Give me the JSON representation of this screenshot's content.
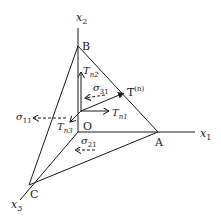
{
  "diagram": {
    "axes": {
      "x1": {
        "base": "x",
        "sub": "1"
      },
      "x2": {
        "base": "x",
        "sub": "2"
      },
      "x3": {
        "base": "x",
        "sub": "3"
      }
    },
    "points": {
      "origin": "O",
      "a": "A",
      "b": "B",
      "c": "C"
    },
    "traction": {
      "base": "T",
      "sup": "(n)"
    },
    "components": {
      "tn1": {
        "base": "T",
        "sub": "n1"
      },
      "tn2": {
        "base": "T",
        "sub": "n2"
      },
      "tn3": {
        "base": "T",
        "sub": "n3"
      }
    },
    "stresses": {
      "s11": {
        "base": "σ",
        "sub": "11"
      },
      "s21": {
        "base": "σ",
        "sub": "21"
      },
      "s31": {
        "base": "σ",
        "sub": "31"
      }
    }
  }
}
